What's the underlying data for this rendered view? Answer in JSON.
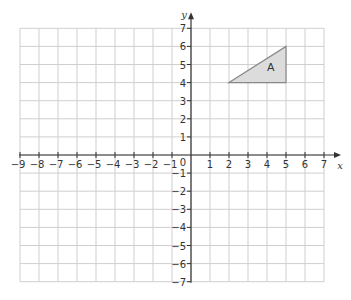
{
  "diagram": {
    "type": "coordinate-grid",
    "x_axis": {
      "label": "x",
      "min": -9,
      "max": 7,
      "ticks": [
        -9,
        -8,
        -7,
        -6,
        -5,
        -4,
        -3,
        -2,
        -1,
        1,
        2,
        3,
        4,
        5,
        6,
        7
      ]
    },
    "y_axis": {
      "label": "y",
      "min": -7,
      "max": 7,
      "ticks": [
        7,
        6,
        5,
        4,
        3,
        2,
        1,
        -1,
        -2,
        -3,
        -4,
        -5,
        -6,
        -7
      ]
    },
    "origin_label": "0",
    "shapes": [
      {
        "name": "A",
        "label": "A",
        "vertices": [
          [
            2,
            4
          ],
          [
            5,
            6
          ],
          [
            5,
            4
          ]
        ],
        "fill": "#dcdcdc",
        "stroke": "#888888"
      }
    ],
    "colors": {
      "grid": "#cfcfcf",
      "axis": "#333333",
      "text": "#333333"
    }
  },
  "chart_data": {
    "type": "scatter",
    "title": "",
    "xlabel": "x",
    "ylabel": "y",
    "xlim": [
      -9,
      7
    ],
    "ylim": [
      -7,
      7
    ],
    "grid": true,
    "shapes": [
      {
        "label": "A",
        "kind": "triangle",
        "points": [
          [
            2,
            4
          ],
          [
            5,
            6
          ],
          [
            5,
            4
          ]
        ]
      }
    ]
  }
}
